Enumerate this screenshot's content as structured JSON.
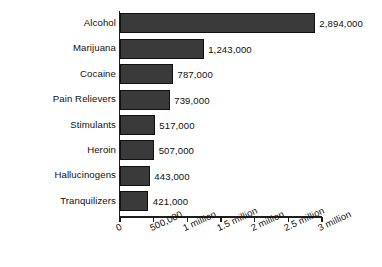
{
  "chart_data": {
    "type": "bar",
    "orientation": "horizontal",
    "title": "",
    "subtitle": "",
    "xlabel": "",
    "ylabel": "",
    "categories": [
      "Alcohol",
      "Marijuana",
      "Cocaine",
      "Pain Relievers",
      "Stimulants",
      "Heroin",
      "Hallucinogens",
      "Tranquilizers"
    ],
    "values": [
      2894000,
      1243000,
      787000,
      739000,
      517000,
      507000,
      443000,
      421000
    ],
    "value_labels": [
      "2,894,000",
      "1,243,000",
      "787,000",
      "739,000",
      "517,000",
      "507,000",
      "443,000",
      "421,000"
    ],
    "xlim": [
      0,
      3000000
    ],
    "xticks": [
      0,
      500000,
      1000000,
      1500000,
      2000000,
      2500000,
      3000000
    ],
    "xtick_labels": [
      "0",
      "500,000",
      "1 million",
      "1.5 million",
      "2 million",
      "2.5 million",
      "3 million"
    ],
    "xtick_label_rotation_deg": -25,
    "grid": false,
    "legend": false,
    "bar_color": "#3a3a3a",
    "bar_edge_color": "#111111",
    "axis_color": "#1d1d1d",
    "background_color": "#ffffff",
    "text_color": "#101010"
  }
}
